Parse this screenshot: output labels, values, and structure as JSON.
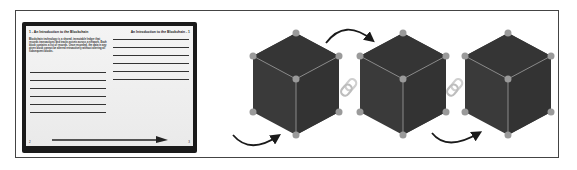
{
  "figure": {
    "book": {
      "left_page": {
        "title": "1 - An Introduction to the Blockchain",
        "body_text": "Blockchain technology is a shared, immutable ledger that records transactions and tracks assets across a network. Each block contains a list of records. Once recorded, the data in any given block cannot be altered retroactively without altering all subsequent blocks.",
        "line_count": 6,
        "page_number": "2"
      },
      "right_page": {
        "title": "An Introduction to the Blockchain - 1",
        "line_count": 6,
        "page_number": "3"
      },
      "arrow": "right-arrow"
    },
    "blocks": [
      {
        "label": "block-1",
        "color": "#3a3a3a"
      },
      {
        "label": "block-2",
        "color": "#3a3a3a"
      },
      {
        "label": "block-3",
        "color": "#3a3a3a"
      }
    ],
    "links": [
      {
        "between": [
          "block-1",
          "block-2"
        ],
        "icon": "chain-link-icon"
      },
      {
        "between": [
          "block-2",
          "block-3"
        ],
        "icon": "chain-link-icon"
      }
    ],
    "arrows": [
      {
        "position": "below-left-of-block-1",
        "icon": "curved-arrow-icon"
      },
      {
        "position": "above-between-block-1-and-2",
        "icon": "curved-arrow-icon"
      },
      {
        "position": "below-between-block-2-and-3",
        "icon": "curved-arrow-icon"
      }
    ],
    "colors": {
      "cube_fill": "#3a3a3a",
      "cube_edge": "#8a8a8a",
      "vertex": "#9a9a9a",
      "link": "#cfcfcf",
      "arrow": "#1a1a1a",
      "frame": "#444444"
    }
  }
}
